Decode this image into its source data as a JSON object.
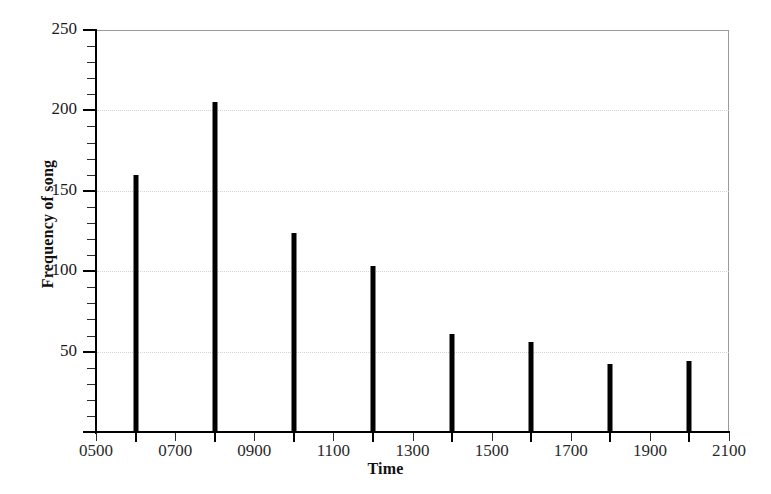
{
  "chart_data": {
    "type": "bar",
    "title": "",
    "xlabel": "Time",
    "ylabel": "Frequency of song",
    "categories": [
      "0600",
      "0800",
      "1000",
      "1200",
      "1400",
      "1600",
      "1800",
      "2000"
    ],
    "values": [
      160,
      205,
      124,
      103,
      61,
      56,
      42,
      44
    ],
    "x": [
      600,
      800,
      1000,
      1200,
      1400,
      1600,
      1800,
      2000
    ],
    "xlim": [
      500,
      2100
    ],
    "ylim": [
      0,
      250
    ],
    "xticks": [
      500,
      700,
      900,
      1100,
      1300,
      1500,
      1700,
      1900,
      2100
    ],
    "xtick_labels": [
      "0500",
      "0700",
      "0900",
      "1100",
      "1300",
      "1500",
      "1700",
      "1900",
      "2100"
    ],
    "yticks": [
      0,
      50,
      100,
      150,
      200,
      250
    ],
    "ytick_labels": [
      "",
      "50",
      "100",
      "150",
      "200",
      "250"
    ],
    "y_minor_tick_step": 10,
    "gridlines_y": [
      50,
      100,
      150,
      200
    ],
    "grid": "horizontal-dotted",
    "legend": "none",
    "bar_color": "#000000",
    "grid_color": "#d4d4d4",
    "axis_color": "#000000",
    "frame_color": "#9a9a9a",
    "background": "#ffffff"
  },
  "axis_titles": {
    "y": "Frequency of song",
    "x": "Time"
  }
}
